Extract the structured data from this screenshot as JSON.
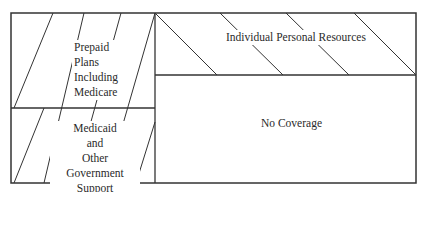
{
  "diagram": {
    "type": "health-care-financing-areas",
    "line_color": "#333333",
    "background": "#ffffff",
    "regions": [
      {
        "id": "prepaid",
        "lines": [
          "Prepaid",
          "Plans",
          "Including",
          "Medicare"
        ],
        "hatch": "forward-diagonal"
      },
      {
        "id": "medicaid",
        "lines": [
          "Medicaid",
          "and",
          "Other Government",
          "Support"
        ],
        "hatch": "forward-diagonal"
      },
      {
        "id": "individual",
        "lines": [
          "Individual Personal Resources"
        ],
        "hatch": "backward-diagonal"
      },
      {
        "id": "no-coverage",
        "lines": [
          "No Coverage"
        ],
        "hatch": "none"
      }
    ]
  }
}
